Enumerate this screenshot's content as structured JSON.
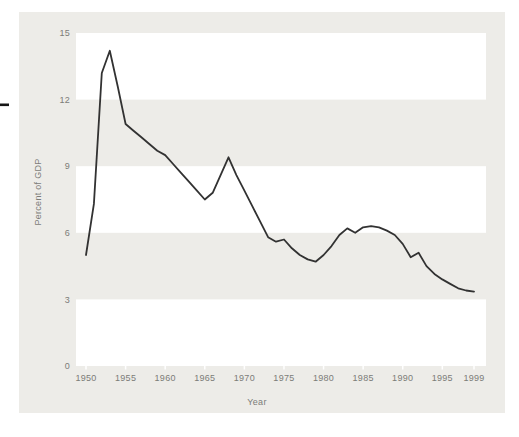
{
  "page": {
    "background_color": "#ffffff",
    "margin_dash_color": "#161616"
  },
  "figure": {
    "panel_color": "#edece8",
    "band_color": "#ffffff",
    "line_color": "#323232",
    "label_color": "#7c7c78",
    "ylabel": "Percent of GDP",
    "xlabel": "Year"
  },
  "chart_data": {
    "type": "line",
    "title": "",
    "xlabel": "Year",
    "ylabel": "Percent of GDP",
    "xlim": [
      1950,
      1999
    ],
    "ylim": [
      0,
      15
    ],
    "grid": "off",
    "legend": "none",
    "background_bands": [
      [
        0,
        3
      ],
      [
        6,
        9
      ],
      [
        12,
        15
      ]
    ],
    "x_ticks": [
      1950,
      1955,
      1960,
      1965,
      1970,
      1975,
      1980,
      1985,
      1990,
      1995,
      1999
    ],
    "y_ticks": [
      0,
      3,
      6,
      9,
      12,
      15
    ],
    "x": [
      1950,
      1951,
      1952,
      1953,
      1954,
      1955,
      1956,
      1957,
      1958,
      1959,
      1960,
      1961,
      1962,
      1963,
      1964,
      1965,
      1966,
      1967,
      1968,
      1969,
      1970,
      1971,
      1972,
      1973,
      1974,
      1975,
      1976,
      1977,
      1978,
      1979,
      1980,
      1981,
      1982,
      1983,
      1984,
      1985,
      1986,
      1987,
      1988,
      1989,
      1990,
      1991,
      1992,
      1993,
      1994,
      1995,
      1996,
      1997,
      1998,
      1999
    ],
    "values": [
      5.0,
      7.3,
      13.2,
      14.2,
      12.6,
      10.9,
      10.6,
      10.3,
      10.0,
      9.7,
      9.5,
      9.1,
      8.7,
      8.3,
      7.9,
      7.5,
      7.8,
      8.6,
      9.4,
      8.6,
      7.9,
      7.2,
      6.5,
      5.8,
      5.6,
      5.7,
      5.3,
      5.0,
      4.8,
      4.7,
      5.0,
      5.4,
      5.9,
      6.2,
      6.0,
      6.25,
      6.3,
      6.25,
      6.1,
      5.9,
      5.5,
      4.9,
      5.1,
      4.5,
      4.15,
      3.9,
      3.7,
      3.5,
      3.4,
      3.35
    ]
  }
}
